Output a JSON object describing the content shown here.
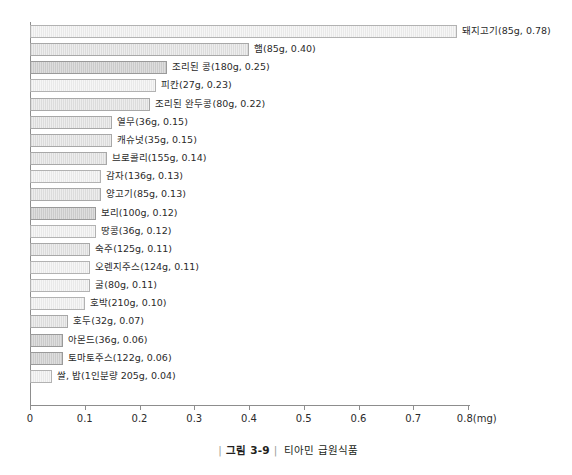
{
  "caption": {
    "figure_number": "그림 3-9",
    "title": "티아민 급원식품",
    "rule": "|"
  },
  "axis": {
    "unit": "(mg)",
    "ticks": [
      "0",
      "0.1",
      "0.2",
      "0.3",
      "0.4",
      "0.5",
      "0.6",
      "0.7",
      "0.8"
    ]
  },
  "chart_data": {
    "type": "bar",
    "orientation": "horizontal",
    "title": "티아민 급원식품",
    "xlabel": "(mg)",
    "ylabel": "",
    "xlim": [
      0,
      0.8
    ],
    "xticks": [
      0,
      0.1,
      0.2,
      0.3,
      0.4,
      0.5,
      0.6,
      0.7,
      0.8
    ],
    "grid": false,
    "legend": "none",
    "categories": [
      "돼지고기",
      "햄",
      "조리된 콩",
      "피칸",
      "조리된 완두콩",
      "열무",
      "캐슈넛",
      "브로콜리",
      "감자",
      "양고기",
      "보리",
      "땅콩",
      "숙주",
      "오렌지주스",
      "굴",
      "호박",
      "호두",
      "아몬드",
      "토마토주스",
      "쌀, 밥"
    ],
    "values": [
      0.78,
      0.4,
      0.25,
      0.23,
      0.22,
      0.15,
      0.15,
      0.14,
      0.13,
      0.13,
      0.12,
      0.12,
      0.11,
      0.11,
      0.11,
      0.1,
      0.07,
      0.06,
      0.06,
      0.04
    ],
    "bars": [
      {
        "label": "돼지고기(85g, 0.78)",
        "food": "돼지고기",
        "serving": "85g",
        "value": 0.78,
        "shade": "light"
      },
      {
        "label": "햄(85g, 0.40)",
        "food": "햄",
        "serving": "85g",
        "value": 0.4,
        "shade": "normal"
      },
      {
        "label": "조리된 콩(180g, 0.25)",
        "food": "조리된 콩",
        "serving": "180g",
        "value": 0.25,
        "shade": "dark"
      },
      {
        "label": "피칸(27g, 0.23)",
        "food": "피칸",
        "serving": "27g",
        "value": 0.23,
        "shade": "light"
      },
      {
        "label": "조리된 완두콩(80g, 0.22)",
        "food": "조리된 완두콩",
        "serving": "80g",
        "value": 0.22,
        "shade": "normal"
      },
      {
        "label": "열무(36g, 0.15)",
        "food": "열무",
        "serving": "36g",
        "value": 0.15,
        "shade": "normal"
      },
      {
        "label": "캐슈넛(35g, 0.15)",
        "food": "캐슈넛",
        "serving": "35g",
        "value": 0.15,
        "shade": "normal"
      },
      {
        "label": "브로콜리(155g, 0.14)",
        "food": "브로콜리",
        "serving": "155g",
        "value": 0.14,
        "shade": "normal"
      },
      {
        "label": "감자(136g, 0.13)",
        "food": "감자",
        "serving": "136g",
        "value": 0.13,
        "shade": "light"
      },
      {
        "label": "양고기(85g, 0.13)",
        "food": "양고기",
        "serving": "85g",
        "value": 0.13,
        "shade": "normal"
      },
      {
        "label": "보리(100g, 0.12)",
        "food": "보리",
        "serving": "100g",
        "value": 0.12,
        "shade": "dark"
      },
      {
        "label": "땅콩(36g, 0.12)",
        "food": "땅콩",
        "serving": "36g",
        "value": 0.12,
        "shade": "light"
      },
      {
        "label": "숙주(125g, 0.11)",
        "food": "숙주",
        "serving": "125g",
        "value": 0.11,
        "shade": "normal"
      },
      {
        "label": "오렌지주스(124g, 0.11)",
        "food": "오렌지주스",
        "serving": "124g",
        "value": 0.11,
        "shade": "light"
      },
      {
        "label": "굴(80g, 0.11)",
        "food": "굴",
        "serving": "80g",
        "value": 0.11,
        "shade": "light"
      },
      {
        "label": "호박(210g, 0.10)",
        "food": "호박",
        "serving": "210g",
        "value": 0.1,
        "shade": "light"
      },
      {
        "label": "호두(32g, 0.07)",
        "food": "호두",
        "serving": "32g",
        "value": 0.07,
        "shade": "normal"
      },
      {
        "label": "아몬드(36g, 0.06)",
        "food": "아몬드",
        "serving": "36g",
        "value": 0.06,
        "shade": "dark"
      },
      {
        "label": "토마토주스(122g, 0.06)",
        "food": "토마토주스",
        "serving": "122g",
        "value": 0.06,
        "shade": "dark"
      },
      {
        "label": "쌀, 밥(1인분량 205g, 0.04)",
        "food": "쌀, 밥",
        "serving": "1인분량 205g",
        "value": 0.04,
        "shade": "light"
      }
    ]
  }
}
